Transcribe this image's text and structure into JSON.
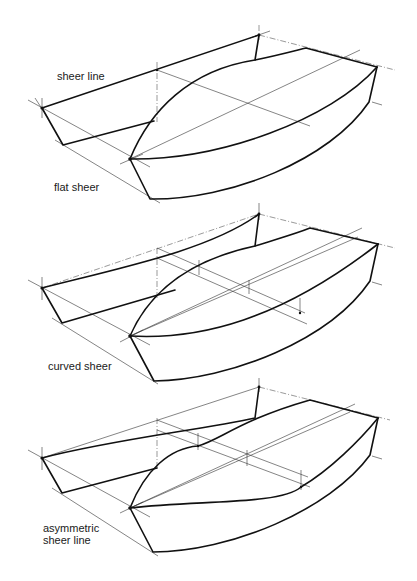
{
  "figure": {
    "type": "technical boat hull drawing",
    "panels": [
      {
        "id": "flat",
        "labels": [
          "sheer line",
          "flat sheer"
        ]
      },
      {
        "id": "curved",
        "labels": [
          "curved sheer"
        ]
      },
      {
        "id": "asymmetric",
        "labels": [
          "asymmetric",
          "sheer line"
        ]
      }
    ]
  },
  "labels": {
    "panel1_top": "sheer line",
    "panel1_bottom": "flat sheer",
    "panel2_bottom": "curved sheer",
    "panel3_line1": "asymmetric",
    "panel3_line2": "sheer line"
  },
  "colors": {
    "line": "#111111",
    "construction_line": "#555555",
    "background": "#ffffff"
  }
}
